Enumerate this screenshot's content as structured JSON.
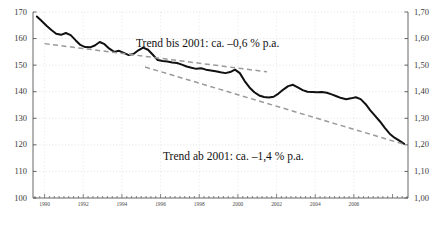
{
  "chart_data": {
    "type": "line",
    "title": "",
    "subtitle": "",
    "xlabel": "",
    "ylabel": "",
    "xlim": [
      1989.4,
      2008.8
    ],
    "ylim": [
      100,
      170
    ],
    "grid": true,
    "legend_position": "none",
    "axis_left": {
      "label": "",
      "ticks": [
        "170",
        "160",
        "150",
        "140",
        "130",
        "120",
        "110",
        "100"
      ],
      "tick_values": [
        170,
        160,
        150,
        140,
        130,
        120,
        110,
        100
      ],
      "min": 100,
      "max": 170
    },
    "axis_right": {
      "label": "",
      "ticks": [
        "1,70",
        "1,60",
        "1,50",
        "1,40",
        "1,30",
        "1,20",
        "1,10",
        "1,00"
      ],
      "tick_values": [
        1.7,
        1.6,
        1.5,
        1.4,
        1.3,
        1.2,
        1.1,
        1.0
      ],
      "min": 1.0,
      "max": 1.7
    },
    "axis_x": {
      "ticks": [
        "1990",
        "1992",
        "1994",
        "1996",
        "1998",
        "2000",
        "2002",
        "2004",
        "2006"
      ],
      "tick_values": [
        1990,
        1992,
        1994,
        1996,
        1998,
        2000,
        2002,
        2004,
        2006
      ],
      "minor_tick_step": 0.25
    },
    "series": [
      {
        "name": "Index",
        "style": "solid",
        "color": "#111111",
        "x": [
          1989.6,
          1989.85,
          1990.1,
          1990.35,
          1990.6,
          1990.85,
          1991.1,
          1991.35,
          1991.6,
          1991.85,
          1992.1,
          1992.35,
          1992.6,
          1992.85,
          1993.1,
          1993.35,
          1993.6,
          1993.85,
          1994.1,
          1994.35,
          1994.6,
          1994.85,
          1995.1,
          1995.35,
          1995.6,
          1995.85,
          1996.1,
          1996.35,
          1996.6,
          1996.85,
          1997.1,
          1997.35,
          1997.6,
          1997.85,
          1998.1,
          1998.35,
          1998.6,
          1998.85,
          1999.1,
          1999.35,
          1999.6,
          1999.85,
          2000.1,
          2000.35,
          2000.6,
          2000.85,
          2001.1,
          2001.35,
          2001.6,
          2001.85,
          2002.1,
          2002.35,
          2002.6,
          2002.85,
          2003.1,
          2003.35,
          2003.6,
          2003.85,
          2004.1,
          2004.35,
          2004.6,
          2004.85,
          2005.1,
          2005.35,
          2005.6,
          2005.85,
          2006.1,
          2006.35,
          2006.6,
          2006.85,
          2007.1,
          2007.35,
          2007.6,
          2007.85,
          2008.1,
          2008.35,
          2008.6
        ],
        "y": [
          168.3,
          166.6,
          164.8,
          163.2,
          161.8,
          161.4,
          162.1,
          161.3,
          159.4,
          157.6,
          156.8,
          156.7,
          157.4,
          158.7,
          157.9,
          156.2,
          155.0,
          155.4,
          154.6,
          153.8,
          154.2,
          155.6,
          156.6,
          155.8,
          153.9,
          151.9,
          151.6,
          151.4,
          151.0,
          150.8,
          150.2,
          149.5,
          149.0,
          148.6,
          148.8,
          148.3,
          148.0,
          147.7,
          147.3,
          147.0,
          147.4,
          148.3,
          147.0,
          144.0,
          141.6,
          139.8,
          138.6,
          138.0,
          137.8,
          138.1,
          139.3,
          140.8,
          142.1,
          142.6,
          141.6,
          140.6,
          140.0,
          139.9,
          139.8,
          139.9,
          139.6,
          139.0,
          138.3,
          137.6,
          137.2,
          137.5,
          137.9,
          137.2,
          135.4,
          133.0,
          130.9,
          128.8,
          126.4,
          124.2,
          122.7,
          121.6,
          120.4
        ]
      },
      {
        "name": "Trend bis 2001",
        "style": "dashed",
        "color": "#9a9a9a",
        "x": [
          1990.0,
          2001.5
        ],
        "y": [
          158.1,
          147.5
        ]
      },
      {
        "name": "Trend ab 2001",
        "style": "dashed",
        "color": "#9a9a9a",
        "x": [
          1995.2,
          2008.6
        ],
        "y": [
          149.3,
          120.2
        ]
      }
    ],
    "annotations": [
      {
        "id": "trend-annotation-1",
        "text": "Trend bis 2001: ca. –0,6 % p.a.",
        "x_px": 136,
        "y_px": 38
      },
      {
        "id": "trend-annotation-2",
        "text": "Trend ab 2001: ca. –1,4 % p.a.",
        "x_px": 163,
        "y_px": 151
      }
    ]
  }
}
